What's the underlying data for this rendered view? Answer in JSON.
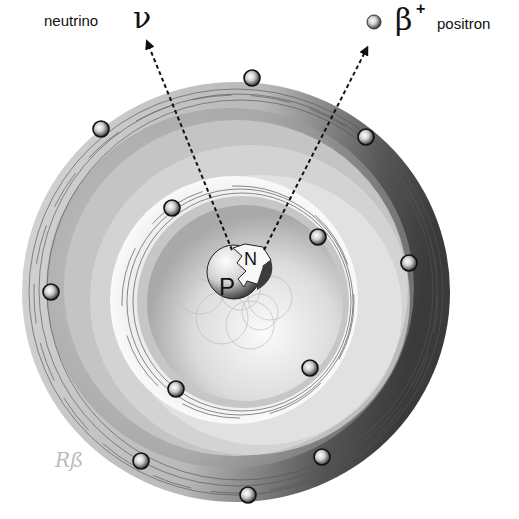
{
  "labels": {
    "neutrino_text": "neutrino",
    "neutrino_symbol": "ν",
    "positron_symbol": "β",
    "positron_charge": "+",
    "positron_text": "positron",
    "signature": "Rß"
  },
  "nucleus": {
    "proton_label": "P",
    "neutron_label": "N"
  },
  "electrons": {
    "inner_shell_count": 4,
    "outer_shell_count": 8
  },
  "colors": {
    "background": "#ffffff",
    "text": "#111111",
    "shell_dark": "#4a4a4a",
    "shell_light": "#f2f2f2"
  }
}
